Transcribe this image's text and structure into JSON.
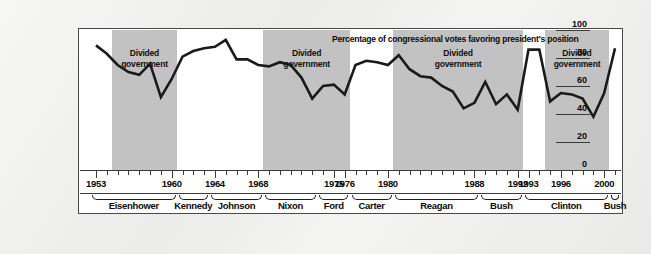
{
  "chart_data": {
    "type": "line",
    "title": "Percentage of congressional votes favoring president's position",
    "xlabel": "",
    "ylabel": "",
    "ylim": [
      0,
      100
    ],
    "yticks": [
      100,
      80,
      60,
      40,
      20,
      0
    ],
    "xlim": [
      1953,
      2001
    ],
    "grid": false,
    "legend": null,
    "series": [
      {
        "name": "Presidential support in Congress",
        "color": "#1a1a1a",
        "x": [
          1953,
          1954,
          1955,
          1956,
          1957,
          1958,
          1959,
          1960,
          1961,
          1962,
          1963,
          1964,
          1965,
          1966,
          1967,
          1968,
          1969,
          1970,
          1971,
          1972,
          1973,
          1974,
          1975,
          1976,
          1977,
          1978,
          1979,
          1980,
          1981,
          1982,
          1983,
          1984,
          1985,
          1986,
          1987,
          1988,
          1989,
          1990,
          1991,
          1992,
          1993,
          1994,
          1995,
          1996,
          1997,
          1998,
          1999,
          2000,
          2001
        ],
        "values": [
          89,
          83,
          75,
          70,
          68,
          76,
          52,
          65,
          81,
          85,
          87,
          88,
          93,
          79,
          79,
          75,
          74,
          77,
          75,
          66,
          51,
          60,
          61,
          54,
          75,
          78,
          77,
          75,
          82,
          72,
          67,
          66,
          60,
          56,
          44,
          48,
          63,
          47,
          54,
          43,
          86,
          86,
          49,
          55,
          54,
          51,
          38,
          55,
          87
        ]
      }
    ],
    "shaded_regions": [
      {
        "label_line1": "Divided",
        "label_line2": "government",
        "start": 1955,
        "end": 1961
      },
      {
        "label_line1": "Divided",
        "label_line2": "government",
        "start": 1969,
        "end": 1977
      },
      {
        "label_line1": "Divided",
        "label_line2": "government",
        "start": 1981,
        "end": 1993
      },
      {
        "label_line1": "Divided",
        "label_line2": "government",
        "start": 1995,
        "end": 2001
      }
    ],
    "year_labels": [
      {
        "year": 1953,
        "text": "1953"
      },
      {
        "year": 1960,
        "text": "1960"
      },
      {
        "year": 1964,
        "text": "1964"
      },
      {
        "year": 1968,
        "text": "1968"
      },
      {
        "year": 1975,
        "text": "1975"
      },
      {
        "year": 1976,
        "text": "1976"
      },
      {
        "year": 1980,
        "text": "1980"
      },
      {
        "year": 1988,
        "text": "1988"
      },
      {
        "year": 1992,
        "text": "1992"
      },
      {
        "year": 1993,
        "text": "1993"
      },
      {
        "year": 1996,
        "text": "1996"
      },
      {
        "year": 2000,
        "text": "2000"
      }
    ],
    "presidents": [
      {
        "name": "Eisenhower",
        "start": 1953,
        "end": 1961
      },
      {
        "name": "Kennedy",
        "start": 1961,
        "end": 1964
      },
      {
        "name": "Johnson",
        "start": 1964,
        "end": 1969
      },
      {
        "name": "Nixon",
        "start": 1969,
        "end": 1974
      },
      {
        "name": "Ford",
        "start": 1974,
        "end": 1977
      },
      {
        "name": "Carter",
        "start": 1977,
        "end": 1981
      },
      {
        "name": "Reagan",
        "start": 1981,
        "end": 1989
      },
      {
        "name": "Bush",
        "start": 1989,
        "end": 1993
      },
      {
        "name": "Clinton",
        "start": 1993,
        "end": 2001
      },
      {
        "name": "Bush",
        "start": 2001,
        "end": 2002
      }
    ]
  }
}
